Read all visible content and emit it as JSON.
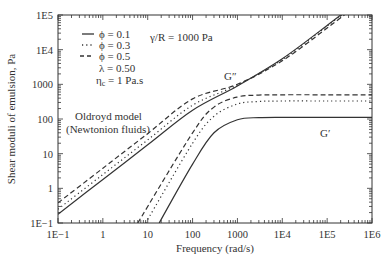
{
  "chart_data": {
    "type": "line",
    "title": "",
    "xlabel": "Frequency (rad/s)",
    "ylabel": "Shear moduli of emulsion, Pa",
    "xscale": "log",
    "yscale": "log",
    "xlim": [
      0.1,
      1000000
    ],
    "ylim": [
      0.1,
      100000
    ],
    "x_tick_labels": [
      "1E−1",
      "1",
      "10",
      "100",
      "1000",
      "1E4",
      "1E5",
      "1E6"
    ],
    "y_tick_labels": [
      "1E−1",
      "1",
      "10",
      "100",
      "1000",
      "1E4",
      "1E5"
    ],
    "grid": false,
    "legend": {
      "position": "upper-left",
      "entries": [
        {
          "label": "ϕ = 0.1",
          "style": "solid"
        },
        {
          "label": "ϕ = 0.3",
          "style": "dotted"
        },
        {
          "label": "ϕ = 0.5",
          "style": "dashed"
        }
      ],
      "params": [
        "λ = 0.50",
        "ηc = 1 Pa.s"
      ]
    },
    "annotations": [
      {
        "text": "γ/R = 1000 Pa",
        "x": 30,
        "y": 8000
      },
      {
        "text": "G″",
        "x": 600,
        "y": 1200
      },
      {
        "text": "G′",
        "x": 150000,
        "y": 40
      },
      {
        "text": "Oldroyd model",
        "x": 1,
        "y": 100
      },
      {
        "text": "(Newtonion fluids)",
        "x": 1,
        "y": 50
      }
    ],
    "series": [
      {
        "name": "G″, ϕ = 0.1",
        "style": "solid",
        "x": [
          0.1,
          1,
          10,
          100,
          1000,
          10000,
          100000,
          1000000
        ],
        "y": [
          0.18,
          1.8,
          18,
          180,
          900,
          5500,
          50000,
          500000
        ]
      },
      {
        "name": "G″, ϕ = 0.3",
        "style": "dotted",
        "x": [
          0.1,
          1,
          10,
          100,
          1000,
          10000,
          100000,
          1000000
        ],
        "y": [
          0.25,
          2.5,
          25,
          250,
          950,
          5200,
          48000,
          480000
        ]
      },
      {
        "name": "G″, ϕ = 0.5",
        "style": "dashed",
        "x": [
          0.1,
          1,
          10,
          100,
          1000,
          10000,
          100000,
          1000000
        ],
        "y": [
          0.38,
          3.8,
          38,
          380,
          1000,
          4800,
          42000,
          420000
        ]
      },
      {
        "name": "G′, ϕ = 0.1",
        "style": "solid",
        "x": [
          18,
          100,
          300,
          1000,
          3000,
          10000,
          100000,
          1000000
        ],
        "y": [
          0.1,
          5,
          40,
          95,
          110,
          112,
          112,
          112
        ]
      },
      {
        "name": "G′, ϕ = 0.3",
        "style": "dotted",
        "x": [
          9,
          100,
          300,
          1000,
          3000,
          10000,
          100000,
          1000000
        ],
        "y": [
          0.1,
          20,
          120,
          270,
          320,
          330,
          330,
          330
        ]
      },
      {
        "name": "G′, ϕ = 0.5",
        "style": "dashed",
        "x": [
          6,
          100,
          300,
          1000,
          3000,
          10000,
          100000,
          1000000
        ],
        "y": [
          0.1,
          40,
          220,
          430,
          490,
          500,
          500,
          500
        ]
      }
    ]
  },
  "labels": {
    "xlabel": "Frequency (rad/s)",
    "ylabel": "Shear moduli of emulsion, Pa",
    "legend_1": "ϕ = 0.1",
    "legend_2": "ϕ = 0.3",
    "legend_3": "ϕ = 0.5",
    "lambda": "λ = 0.50",
    "eta_prefix": "η",
    "eta_sub": "c",
    "eta_suffix": " = 1 Pa.s",
    "gamma": "γ/R = 1000 Pa",
    "gpp": "G″",
    "gp": "G′",
    "oldroyd_1": "Oldroyd model",
    "oldroyd_2": "(Newtonion fluids)"
  }
}
